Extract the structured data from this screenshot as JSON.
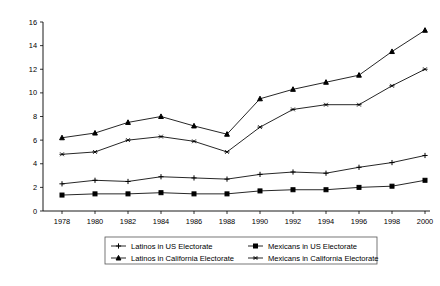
{
  "chart_data": {
    "type": "line",
    "title": "",
    "subtitle": "",
    "xlabel": "",
    "ylabel": "",
    "x": [
      1978,
      1980,
      1982,
      1984,
      1986,
      1988,
      1990,
      1992,
      1994,
      1996,
      1998,
      2000
    ],
    "xtick_labels": [
      "1978",
      "1980",
      "1982",
      "1984",
      "1986",
      "1988",
      "1990",
      "1992",
      "1994",
      "1996",
      "1998",
      "2000"
    ],
    "ytick_labels": [
      "0",
      "2",
      "4",
      "6",
      "8",
      "10",
      "12",
      "14",
      "16"
    ],
    "yticks": [
      0,
      2,
      4,
      6,
      8,
      10,
      12,
      14,
      16
    ],
    "xlim": [
      1978,
      2000
    ],
    "ylim": [
      0,
      16
    ],
    "grid": false,
    "legend_position": "bottom",
    "series": [
      {
        "name": "Latinos in US Electorate",
        "marker": "plus",
        "values": [
          2.3,
          2.6,
          2.5,
          2.9,
          2.8,
          2.7,
          3.1,
          3.3,
          3.2,
          3.7,
          4.1,
          4.7
        ]
      },
      {
        "name": "Mexicans in US Electorate",
        "marker": "square",
        "values": [
          1.35,
          1.45,
          1.45,
          1.55,
          1.45,
          1.45,
          1.7,
          1.8,
          1.8,
          2.0,
          2.1,
          2.6
        ]
      },
      {
        "name": "Latinos in California Electorate",
        "marker": "triangle",
        "values": [
          6.2,
          6.6,
          7.5,
          8.0,
          7.2,
          6.5,
          9.5,
          10.3,
          10.9,
          11.5,
          13.5,
          15.3
        ]
      },
      {
        "name": "Mexicans in California Electorate",
        "marker": "star",
        "values": [
          4.8,
          5.0,
          6.0,
          6.3,
          5.9,
          5.0,
          7.1,
          8.6,
          9.0,
          9.0,
          10.6,
          12.0
        ]
      }
    ],
    "legend_entries": [
      "Latinos in US Electorate",
      "Mexicans in US Electorate",
      "Latinos in California Electorate",
      "Mexicans in California Electorate"
    ],
    "colors": {
      "series": "#000000",
      "axis": "#000000",
      "background": "#ffffff"
    }
  },
  "footer": {
    "caption": ""
  }
}
